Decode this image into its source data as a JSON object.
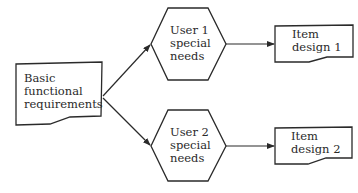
{
  "diagram": {
    "type": "flowchart",
    "colors": {
      "stroke": "#2a2a2a",
      "background": "#ffffff",
      "text": "#2a2a2a"
    },
    "nodes": {
      "basic": {
        "shape": "document",
        "lines": [
          "Basic",
          "functional",
          "requirements"
        ]
      },
      "user1": {
        "shape": "hexagon",
        "lines": [
          "User 1",
          "special",
          "needs"
        ]
      },
      "user2": {
        "shape": "hexagon",
        "lines": [
          "User 2",
          "special",
          "needs"
        ]
      },
      "item1": {
        "shape": "document",
        "lines": [
          "Item",
          "design 1"
        ]
      },
      "item2": {
        "shape": "document",
        "lines": [
          "Item",
          "design 2"
        ]
      }
    },
    "edges": [
      {
        "from": "basic",
        "to": "user1"
      },
      {
        "from": "basic",
        "to": "user2"
      },
      {
        "from": "user1",
        "to": "item1"
      },
      {
        "from": "user2",
        "to": "item2"
      }
    ]
  }
}
